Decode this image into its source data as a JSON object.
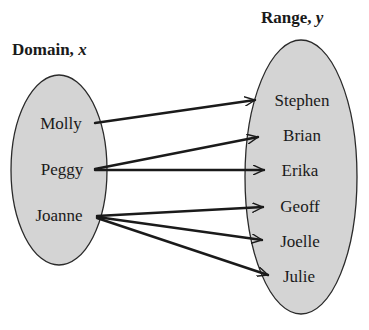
{
  "diagram": {
    "type": "mapping",
    "domain": {
      "title": "Domain,",
      "variable": "x",
      "items": [
        "Molly",
        "Peggy",
        "Joanne"
      ]
    },
    "range": {
      "title": "Range,",
      "variable": "y",
      "items": [
        "Stephen",
        "Brian",
        "Erika",
        "Geoff",
        "Joelle",
        "Julie"
      ]
    },
    "mappings": [
      {
        "from": "Molly",
        "to": "Stephen"
      },
      {
        "from": "Peggy",
        "to": "Brian"
      },
      {
        "from": "Peggy",
        "to": "Erika"
      },
      {
        "from": "Joanne",
        "to": "Geoff"
      },
      {
        "from": "Joanne",
        "to": "Joelle"
      },
      {
        "from": "Joanne",
        "to": "Julie"
      }
    ],
    "colors": {
      "ellipse_fill": "#d4d4d4",
      "ellipse_stroke": "#2a2a2a",
      "arrow": "#1a1a1a",
      "text": "#1a1a1a"
    }
  }
}
